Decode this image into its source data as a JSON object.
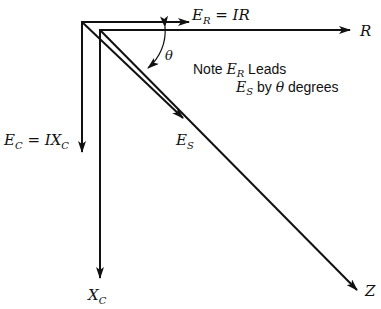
{
  "diagram": {
    "type": "phasor-and-impedance-diagram",
    "labels": {
      "er_main": "E",
      "er_sub": "R",
      "er_eq": " = IR",
      "r_axis": "R",
      "theta": "θ",
      "ec_main": "E",
      "ec_sub": "C",
      "ec_eq": " = IX",
      "ec_eq_sub": "C",
      "es_main": "E",
      "es_sub": "S",
      "xc_main": "X",
      "xc_sub": "C",
      "z_axis": "Z"
    },
    "note": {
      "line1_prefix": "Note ",
      "line1_var": "E",
      "line1_var_sub": "R",
      "line1_suffix": " Leads",
      "line2_var": "E",
      "line2_var_sub": "S",
      "line2_mid": " by ",
      "line2_theta": "θ",
      "line2_suffix": " degrees"
    },
    "vectors": [
      {
        "name": "E_R = IR",
        "from": [
          82,
          22
        ],
        "to": [
          189,
          22
        ]
      },
      {
        "name": "E_C = IX_C",
        "from": [
          82,
          22
        ],
        "to": [
          82,
          152
        ]
      },
      {
        "name": "E_S",
        "from": [
          82,
          22
        ],
        "to": [
          183,
          118
        ]
      },
      {
        "name": "R",
        "from": [
          100,
          30
        ],
        "to": [
          350,
          30
        ]
      },
      {
        "name": "X_C",
        "from": [
          100,
          30
        ],
        "to": [
          100,
          278
        ]
      },
      {
        "name": "Z",
        "from": [
          100,
          30
        ],
        "to": [
          357,
          290
        ]
      }
    ],
    "colors": {
      "ink": "#111111",
      "background": "#ffffff"
    }
  }
}
